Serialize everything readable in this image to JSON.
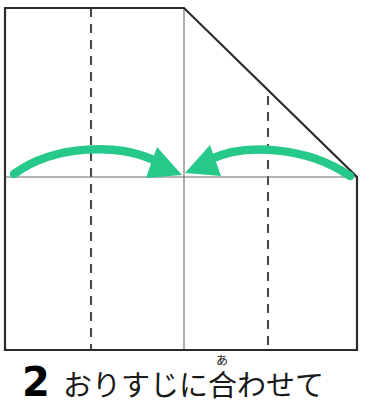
{
  "step": {
    "number": "2",
    "caption_before": "おりすじに",
    "caption_ruby_base": "合",
    "caption_ruby_text": "あ",
    "caption_after": "わせて"
  },
  "colors": {
    "arrow_green": "#26C98A",
    "outline_black": "#2b2b2b",
    "crease_gray": "#4a4a4a",
    "paper_white": "#ffffff",
    "text_black": "#1a1a1a"
  },
  "diagram": {
    "paper_outline": {
      "name": "paper-shape",
      "points": "5,8 184,8 357,177 357,350 5,350"
    },
    "edges": [
      {
        "name": "top-edge",
        "x1": 5,
        "y1": 8,
        "x2": 184,
        "y2": 8
      },
      {
        "name": "diagonal-edge",
        "x1": 184,
        "y1": 8,
        "x2": 357,
        "y2": 177
      },
      {
        "name": "right-edge",
        "x1": 357,
        "y1": 177,
        "x2": 357,
        "y2": 350
      },
      {
        "name": "bottom-edge",
        "x1": 5,
        "y1": 350,
        "x2": 357,
        "y2": 350
      },
      {
        "name": "left-edge",
        "x1": 5,
        "y1": 8,
        "x2": 5,
        "y2": 350
      }
    ],
    "solid_creases": [
      {
        "name": "horizontal-center-crease",
        "x1": 5,
        "y1": 177,
        "x2": 357,
        "y2": 177
      },
      {
        "name": "vertical-center-crease",
        "x1": 184,
        "y1": 8,
        "x2": 184,
        "y2": 350
      }
    ],
    "dashed_creases": [
      {
        "name": "left-quarter-crease",
        "x1": 91,
        "y1": 8,
        "x2": 91,
        "y2": 350
      },
      {
        "name": "right-quarter-crease",
        "x1": 268,
        "y1": 96,
        "x2": 268,
        "y2": 350
      }
    ],
    "arrows": [
      {
        "name": "left-fold-arrow",
        "direction": "right",
        "path": "M 14,174 C 55,144 120,143 160,163",
        "head": "160,150 180,173 149,176"
      },
      {
        "name": "right-fold-arrow",
        "direction": "left",
        "path": "M 349,175 C 305,146 240,144 206,161",
        "head": "208,148 187,171 219,176"
      }
    ]
  }
}
